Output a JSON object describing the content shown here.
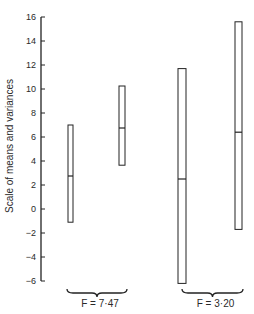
{
  "chart_data": {
    "type": "range-bar",
    "title": "",
    "xlabel": "",
    "ylabel": "Scale of means and variances",
    "ylim": [
      -6,
      16
    ],
    "yticks": [
      16,
      14,
      12,
      10,
      8,
      6,
      4,
      2,
      0,
      -2,
      -4,
      -6
    ],
    "grid": false,
    "legend": null,
    "series": [
      {
        "name": "bar-1",
        "group": 0,
        "low": -1.1,
        "mid": 2.75,
        "high": 7.0
      },
      {
        "name": "bar-2",
        "group": 0,
        "low": 3.65,
        "mid": 6.75,
        "high": 10.25
      },
      {
        "name": "bar-3",
        "group": 1,
        "low": -6.2,
        "mid": 2.5,
        "high": 11.7
      },
      {
        "name": "bar-4",
        "group": 1,
        "low": -1.7,
        "mid": 6.4,
        "high": 15.6
      }
    ],
    "groups": [
      {
        "label": "F = 7·47"
      },
      {
        "label": "F = 3·20"
      }
    ]
  }
}
